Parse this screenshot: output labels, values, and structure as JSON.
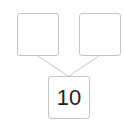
{
  "diagram": {
    "type": "number-bond",
    "parts": [
      {
        "value": ""
      },
      {
        "value": ""
      }
    ],
    "whole": {
      "value": "10"
    },
    "colors": {
      "border": "#c4c4c4",
      "line": "#c4c4c4",
      "text": "#222222"
    }
  }
}
